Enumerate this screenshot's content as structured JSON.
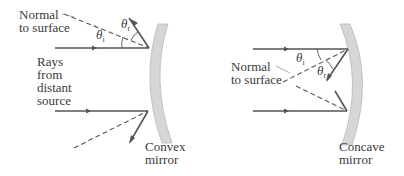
{
  "figure": {
    "left_panel": {
      "normal_label_line1": "Normal",
      "normal_label_line2": "to surface",
      "incident_angle_symbol": "θ",
      "incident_angle_sub": "i",
      "reflected_angle_symbol": "θ",
      "reflected_angle_sub": "r",
      "rays_label_line1": "Rays",
      "rays_label_line2": "from",
      "rays_label_line3": "distant",
      "rays_label_line4": "source",
      "mirror_label_line1": "Convex",
      "mirror_label_line2": "mirror"
    },
    "right_panel": {
      "normal_label_line1": "Normal",
      "normal_label_line2": "to surface",
      "incident_angle_symbol": "θ",
      "incident_angle_sub": "i",
      "reflected_angle_symbol": "θ",
      "reflected_angle_sub": "r",
      "mirror_label_line1": "Concave",
      "mirror_label_line2": "mirror"
    },
    "colors": {
      "ray": "#555555",
      "normal_dashed": "#555555",
      "mirror_fill": "#d6d6d6",
      "mirror_stroke": "#b8b8b8",
      "text": "#3a3a3a"
    }
  }
}
